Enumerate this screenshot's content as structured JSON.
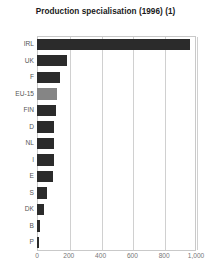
{
  "chart_data": {
    "type": "bar",
    "orientation": "horizontal",
    "title": "Production specialisation (1996) (1)",
    "xlabel": "",
    "ylabel": "",
    "xlim": [
      0,
      1000
    ],
    "ylim": null,
    "grid": true,
    "legend": null,
    "xticks": [
      0,
      200,
      400,
      600,
      800,
      1000
    ],
    "xtick_labels": [
      "0",
      "200",
      "400",
      "600",
      "800",
      "1,000"
    ],
    "categories": [
      "IRL",
      "UK",
      "F",
      "EU-15",
      "FIN",
      "D",
      "NL",
      "I",
      "E",
      "S",
      "DK",
      "B",
      "P"
    ],
    "values": [
      960,
      190,
      147,
      125,
      118,
      110,
      108,
      105,
      100,
      60,
      42,
      22,
      12
    ],
    "highlight_category": "EU-15",
    "colors": {
      "bar": "#2b2b2b",
      "bar_highlight": "#858585",
      "grid": "#d0d0d0",
      "frame": "#c9c9c9",
      "title_text": "#1a1a1a",
      "axis_text": "#777777",
      "category_text": "#555555",
      "background": "#ffffff"
    }
  }
}
